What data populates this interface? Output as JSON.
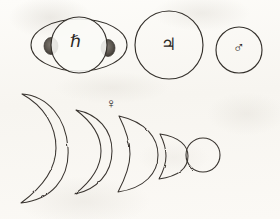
{
  "plate": {
    "title": "Telescopic appearances of Saturn, Jupiter, Mars and the phases of Venus",
    "medium": "engraving on aged paper",
    "width": 280,
    "height": 219,
    "background_color": "#fbfaf7",
    "ink_color": "#2a2724"
  },
  "symbols": {
    "saturn": "ℏ",
    "jupiter": "♃",
    "mars": "♂",
    "venus": "♀"
  },
  "rows": {
    "top": {
      "name": "superior-planets-row",
      "figures": [
        {
          "id": "saturn",
          "label": "Saturn",
          "symbol": "ℏ",
          "form": "globe-with-ring-ellipse",
          "ring": {
            "cx": 79,
            "cy": 45,
            "rx": 48,
            "ry": 26
          },
          "globe": {
            "cx": 79,
            "cy": 45,
            "r": 28
          },
          "ansae": [
            {
              "side": "left",
              "cx": 51,
              "cy": 46,
              "rx": 7,
              "ry": 8
            },
            {
              "side": "right",
              "cx": 108,
              "cy": 48,
              "rx": 7,
              "ry": 8
            }
          ]
        },
        {
          "id": "jupiter",
          "label": "Jupiter",
          "symbol": "♃",
          "form": "plain-disc",
          "disc": {
            "cx": 169,
            "cy": 45,
            "r": 34
          }
        },
        {
          "id": "mars",
          "label": "Mars",
          "symbol": "♂",
          "form": "plain-disc",
          "disc": {
            "cx": 239,
            "cy": 50,
            "r": 23
          }
        }
      ]
    },
    "bottom": {
      "name": "venus-phase-sequence",
      "label": "Venus",
      "symbol": "♀",
      "symbol_position": {
        "x": 113,
        "y": 104
      },
      "direction": "thin crescent at left to full disc at right",
      "phases": [
        {
          "index": 1,
          "name": "thin-crescent",
          "illumination_percent": 8,
          "apparent_size": "largest",
          "cx": 45,
          "cy": 147,
          "r": 55
        },
        {
          "index": 2,
          "name": "crescent",
          "illumination_percent": 18,
          "apparent_size": "large",
          "cx": 95,
          "cy": 150,
          "r": 45
        },
        {
          "index": 3,
          "name": "quarter-gibbous",
          "illumination_percent": 48,
          "apparent_size": "medium",
          "cx": 133,
          "cy": 152,
          "r": 38
        },
        {
          "index": 4,
          "name": "half-gibbous",
          "illumination_percent": 50,
          "apparent_size": "small",
          "cx": 166,
          "cy": 155,
          "r": 24
        },
        {
          "index": 5,
          "name": "full-disc",
          "illumination_percent": 100,
          "apparent_size": "smallest",
          "cx": 203,
          "cy": 155,
          "r": 17
        }
      ]
    }
  }
}
